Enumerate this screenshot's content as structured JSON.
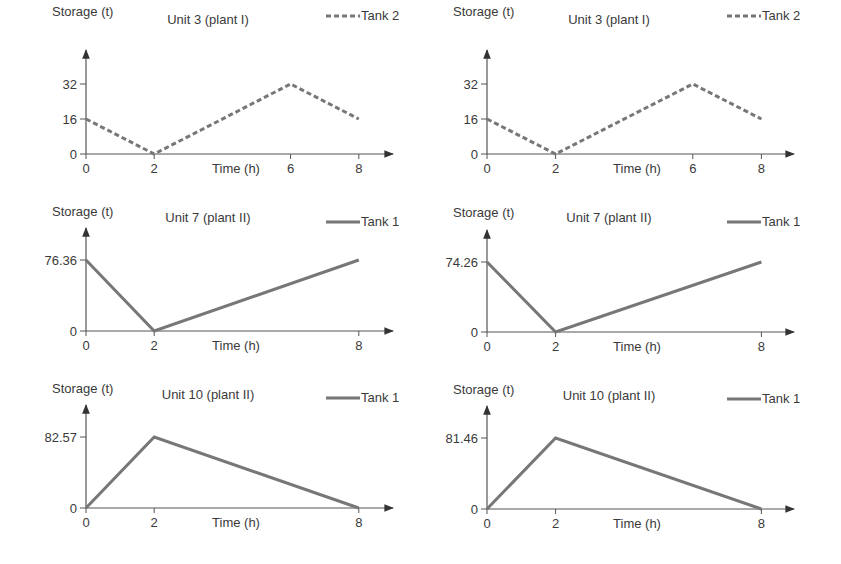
{
  "figure": {
    "background": "#ffffff",
    "axis_color": "#555555",
    "series_color": "#777777"
  },
  "chart_data": [
    {
      "id": "left-unit3",
      "type": "line",
      "title": "Unit 3 (plant I)",
      "xlabel": "Time (h)",
      "ylabel": "Storage (t)",
      "legend": "Tank 2",
      "line_style": "dashed",
      "x_ticks": [
        "0",
        "2",
        "6",
        "8"
      ],
      "y_ticks": [
        "0",
        "16",
        "32"
      ],
      "x": [
        0,
        2,
        6,
        8
      ],
      "values": [
        16,
        0,
        32,
        16
      ],
      "xlim": [
        0,
        8
      ],
      "ylim": [
        0,
        32
      ],
      "grid": false,
      "legend_position": "top-right"
    },
    {
      "id": "right-unit3",
      "type": "line",
      "title": "Unit 3 (plant I)",
      "xlabel": "Time (h)",
      "ylabel": "Storage (t)",
      "legend": "Tank 2",
      "line_style": "dashed",
      "x_ticks": [
        "0",
        "2",
        "6",
        "8"
      ],
      "y_ticks": [
        "0",
        "16",
        "32"
      ],
      "x": [
        0,
        2,
        6,
        8
      ],
      "values": [
        16,
        0,
        32,
        16
      ],
      "xlim": [
        0,
        8
      ],
      "ylim": [
        0,
        32
      ],
      "grid": false,
      "legend_position": "top-right"
    },
    {
      "id": "left-unit7",
      "type": "line",
      "title": "Unit 7 (plant II)",
      "xlabel": "Time (h)",
      "ylabel": "Storage (t)",
      "legend": "Tank 1",
      "line_style": "solid",
      "x_ticks": [
        "0",
        "2",
        "8"
      ],
      "y_ticks": [
        "0",
        "76.36"
      ],
      "x": [
        0,
        2,
        8
      ],
      "values": [
        76.36,
        0,
        76.36
      ],
      "xlim": [
        0,
        8
      ],
      "ylim": [
        0,
        76.36
      ],
      "grid": false,
      "legend_position": "top-right"
    },
    {
      "id": "right-unit7",
      "type": "line",
      "title": "Unit 7 (plant II)",
      "xlabel": "Time (h)",
      "ylabel": "Storage (t)",
      "legend": "Tank 1",
      "line_style": "solid",
      "x_ticks": [
        "0",
        "2",
        "8"
      ],
      "y_ticks": [
        "0",
        "74.26"
      ],
      "x": [
        0,
        2,
        8
      ],
      "values": [
        74.26,
        0,
        74.26
      ],
      "xlim": [
        0,
        8
      ],
      "ylim": [
        0,
        74.26
      ],
      "grid": false,
      "legend_position": "top-right"
    },
    {
      "id": "left-unit10",
      "type": "line",
      "title": "Unit 10 (plant II)",
      "xlabel": "Time (h)",
      "ylabel": "Storage (t)",
      "legend": "Tank 1",
      "line_style": "solid",
      "x_ticks": [
        "0",
        "2",
        "8"
      ],
      "y_ticks": [
        "0",
        "82.57"
      ],
      "x": [
        0,
        2,
        8
      ],
      "values": [
        0,
        82.57,
        0
      ],
      "xlim": [
        0,
        8
      ],
      "ylim": [
        0,
        82.57
      ],
      "grid": false,
      "legend_position": "top-right"
    },
    {
      "id": "right-unit10",
      "type": "line",
      "title": "Unit 10 (plant II)",
      "xlabel": "Time (h)",
      "ylabel": "Storage (t)",
      "legend": "Tank 1",
      "line_style": "solid",
      "x_ticks": [
        "0",
        "2",
        "8"
      ],
      "y_ticks": [
        "0",
        "81.46"
      ],
      "x": [
        0,
        2,
        8
      ],
      "values": [
        0,
        81.46,
        0
      ],
      "xlim": [
        0,
        8
      ],
      "ylim": [
        0,
        81.46
      ],
      "grid": false,
      "legend_position": "top-right"
    }
  ]
}
